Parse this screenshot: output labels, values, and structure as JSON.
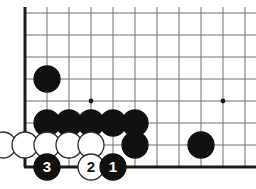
{
  "diagram": {
    "type": "go-board",
    "board": {
      "origin_x": 25,
      "origin_y": 13,
      "spacing": 22,
      "cols": 11,
      "rows": 8,
      "edge_left_thick": true,
      "edge_bottom_thick": true,
      "line_color": "#6f7175",
      "edge_color": "#1a1a1a",
      "background": "#ffffff",
      "line_width": 1,
      "edge_width": 3
    },
    "star_points": [
      {
        "name": "star-point-left",
        "cx": 91,
        "cy": 101
      },
      {
        "name": "star-point-right",
        "cx": 223,
        "cy": 101
      }
    ],
    "stone_radius": 13,
    "stones": [
      {
        "name": "black-stone-a",
        "color": "black",
        "cx": 47,
        "cy": 79,
        "label": ""
      },
      {
        "name": "black-stone-b",
        "color": "black",
        "cx": 47,
        "cy": 123,
        "label": ""
      },
      {
        "name": "black-stone-c",
        "color": "black",
        "cx": 69,
        "cy": 123,
        "label": ""
      },
      {
        "name": "black-stone-d",
        "color": "black",
        "cx": 91,
        "cy": 123,
        "label": ""
      },
      {
        "name": "black-stone-e",
        "color": "black",
        "cx": 113,
        "cy": 123,
        "label": ""
      },
      {
        "name": "black-stone-f",
        "color": "black",
        "cx": 135,
        "cy": 123,
        "label": ""
      },
      {
        "name": "black-stone-g",
        "color": "black",
        "cx": 135,
        "cy": 145,
        "label": ""
      },
      {
        "name": "black-stone-h",
        "color": "black",
        "cx": 201,
        "cy": 145,
        "label": ""
      },
      {
        "name": "white-stone-a",
        "color": "white",
        "cx": 3,
        "cy": 145,
        "label": ""
      },
      {
        "name": "white-stone-b",
        "color": "white",
        "cx": 25,
        "cy": 145,
        "label": ""
      },
      {
        "name": "white-stone-c",
        "color": "white",
        "cx": 47,
        "cy": 145,
        "label": ""
      },
      {
        "name": "white-stone-d",
        "color": "white",
        "cx": 69,
        "cy": 145,
        "label": ""
      },
      {
        "name": "white-stone-e",
        "color": "white",
        "cx": 91,
        "cy": 145,
        "label": ""
      },
      {
        "name": "move-stone-3",
        "color": "black",
        "cx": 47,
        "cy": 167,
        "label": "3"
      },
      {
        "name": "move-stone-2",
        "color": "white",
        "cx": 91,
        "cy": 167,
        "label": "2"
      },
      {
        "name": "move-stone-1",
        "color": "black",
        "cx": 113,
        "cy": 167,
        "label": "1"
      }
    ],
    "colors": {
      "black_fill": "#111111",
      "black_stroke": "#111111",
      "white_fill": "#ffffff",
      "white_stroke": "#2b2b2b",
      "black_label": "#ffffff",
      "white_label": "#111111"
    },
    "move_sequence": [
      "1",
      "2",
      "3"
    ]
  }
}
